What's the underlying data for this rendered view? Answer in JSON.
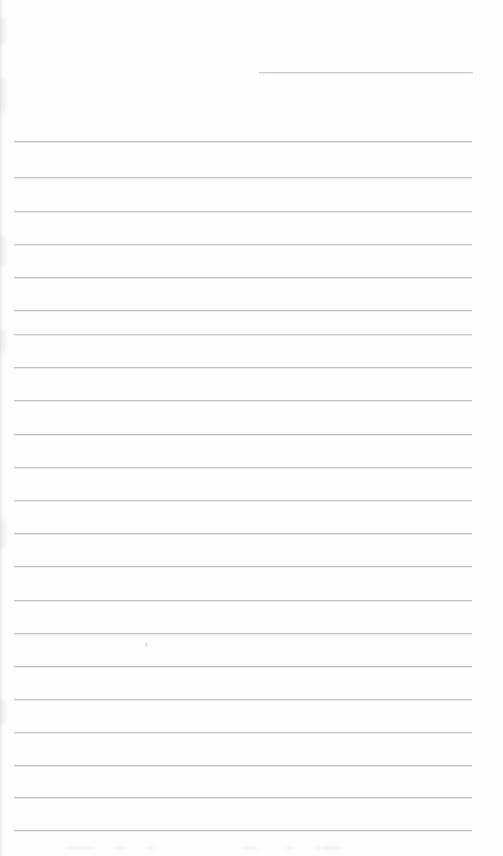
{
  "page": {
    "kind": "scanned-lined-paper",
    "width": 503,
    "height": 856,
    "background_color": "#fefefe",
    "content_text": "",
    "is_blank": true
  },
  "ruling": {
    "line_color": "#bcc0c4",
    "line_faint_color": "#c9cdd0",
    "line_thickness_px": 1,
    "line_spacing_px": 33.3,
    "left_margin_px": 14,
    "right_margin_px": 472,
    "line_count": 23,
    "lines": [
      {
        "name": "rule-line-01",
        "y": 72,
        "x1": 259,
        "x2": 473,
        "faint": true,
        "partial": true
      },
      {
        "name": "rule-line-02",
        "y": 141,
        "x1": 14,
        "x2": 472,
        "faint": false,
        "partial": false
      },
      {
        "name": "rule-line-03",
        "y": 177,
        "x1": 14,
        "x2": 472,
        "faint": false,
        "partial": false
      },
      {
        "name": "rule-line-04",
        "y": 211,
        "x1": 14,
        "x2": 472,
        "faint": false,
        "partial": false
      },
      {
        "name": "rule-line-05",
        "y": 244,
        "x1": 14,
        "x2": 472,
        "faint": false,
        "partial": false
      },
      {
        "name": "rule-line-06",
        "y": 277,
        "x1": 14,
        "x2": 472,
        "faint": false,
        "partial": false
      },
      {
        "name": "rule-line-07",
        "y": 310,
        "x1": 14,
        "x2": 472,
        "faint": false,
        "partial": false
      },
      {
        "name": "rule-line-08",
        "y": 334,
        "x1": 14,
        "x2": 472,
        "faint": true,
        "partial": false
      },
      {
        "name": "rule-line-09",
        "y": 367,
        "x1": 14,
        "x2": 472,
        "faint": false,
        "partial": false
      },
      {
        "name": "rule-line-10",
        "y": 400,
        "x1": 14,
        "x2": 472,
        "faint": false,
        "partial": false
      },
      {
        "name": "rule-line-11",
        "y": 434,
        "x1": 14,
        "x2": 472,
        "faint": false,
        "partial": false
      },
      {
        "name": "rule-line-12",
        "y": 467,
        "x1": 14,
        "x2": 472,
        "faint": false,
        "partial": false
      },
      {
        "name": "rule-line-13",
        "y": 500,
        "x1": 14,
        "x2": 472,
        "faint": false,
        "partial": false
      },
      {
        "name": "rule-line-14",
        "y": 533,
        "x1": 14,
        "x2": 472,
        "faint": false,
        "partial": false
      },
      {
        "name": "rule-line-15",
        "y": 566,
        "x1": 14,
        "x2": 472,
        "faint": false,
        "partial": false
      },
      {
        "name": "rule-line-16",
        "y": 600,
        "x1": 14,
        "x2": 472,
        "faint": false,
        "partial": false
      },
      {
        "name": "rule-line-17",
        "y": 633,
        "x1": 14,
        "x2": 472,
        "faint": false,
        "partial": false
      },
      {
        "name": "rule-line-18",
        "y": 666,
        "x1": 14,
        "x2": 472,
        "faint": false,
        "partial": false
      },
      {
        "name": "rule-line-19",
        "y": 699,
        "x1": 14,
        "x2": 472,
        "faint": false,
        "partial": false
      },
      {
        "name": "rule-line-20",
        "y": 732,
        "x1": 14,
        "x2": 472,
        "faint": false,
        "partial": false
      },
      {
        "name": "rule-line-21",
        "y": 765,
        "x1": 14,
        "x2": 472,
        "faint": false,
        "partial": false
      },
      {
        "name": "rule-line-22",
        "y": 797,
        "x1": 14,
        "x2": 472,
        "faint": false,
        "partial": false
      },
      {
        "name": "rule-line-23",
        "y": 830,
        "x1": 14,
        "x2": 472,
        "faint": false,
        "partial": false
      }
    ]
  },
  "artifacts": {
    "left_edge_shadow": {
      "x": 0,
      "y": 0,
      "width": 6,
      "height": 856
    },
    "edge_blotches": [
      {
        "y": 18,
        "height": 26
      },
      {
        "y": 78,
        "height": 34
      },
      {
        "y": 236,
        "height": 30
      },
      {
        "y": 330,
        "height": 22
      },
      {
        "y": 520,
        "height": 28
      },
      {
        "y": 700,
        "height": 24
      }
    ],
    "dust_speck": {
      "x": 145,
      "y": 643
    },
    "bottom_noise_band": {
      "y": 840,
      "height": 16
    }
  }
}
